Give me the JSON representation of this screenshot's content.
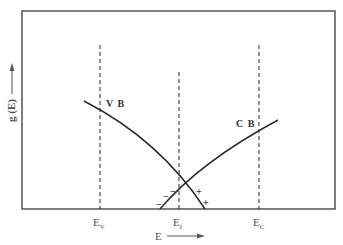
{
  "diagram": {
    "type": "band density of states diagram",
    "y_axis_label": "g (E)",
    "x_axis_label": "E",
    "colors": {
      "stroke": "#2b2b2b",
      "frame": "#3a3a3a",
      "dashed": "#3a3a3a",
      "text": "#333333"
    },
    "bands": [
      {
        "id": "vb",
        "label": "V B"
      },
      {
        "id": "cb",
        "label": "C B"
      }
    ],
    "levels": [
      {
        "id": "ev",
        "label_main": "E",
        "label_sub": "V"
      },
      {
        "id": "ef",
        "label_main": "E",
        "label_sub": "f"
      },
      {
        "id": "ec",
        "label_main": "E",
        "label_sub": "C"
      }
    ],
    "signs": {
      "minus_1": "−",
      "minus_2": "−",
      "minus_3": "−",
      "plus_1": "+",
      "plus_2": "+"
    }
  }
}
